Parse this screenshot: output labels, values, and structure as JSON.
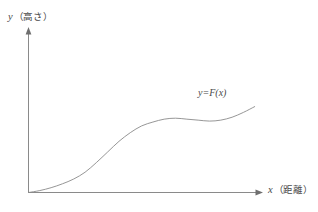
{
  "figure": {
    "background_color": "#ffffff",
    "line_color": "#8a8a8a",
    "text_color": "#4a4a4a"
  },
  "chart_data": {
    "type": "line",
    "title": "",
    "xlabel_var": "x",
    "xlabel_note": "（距離）",
    "ylabel_var": "y",
    "ylabel_note": "（高さ）",
    "series": [
      {
        "name": "y=F(x)",
        "label_var": "y=F(",
        "label_arg": "x",
        "label_close": ")",
        "x": [
          0,
          10,
          20,
          30,
          40,
          50,
          60,
          70,
          80,
          90,
          100,
          110,
          120,
          130,
          140,
          150,
          160,
          170,
          180,
          190,
          200
        ],
        "y": [
          0,
          2,
          5,
          9,
          14,
          21,
          31,
          42,
          53,
          62,
          69,
          73,
          76,
          77,
          76,
          75,
          74,
          75,
          78,
          83,
          89
        ]
      }
    ],
    "xlim": [
      0,
      210
    ],
    "ylim": [
      0,
      100
    ],
    "grid": false,
    "legend": "none",
    "axis_arrows": true,
    "annotations": [
      {
        "text": "y=F(x)",
        "x": 150,
        "y": 96
      }
    ]
  },
  "labels": {
    "y_axis": "y（高さ）",
    "x_axis": "x（距離）",
    "curve": "y=F(x)"
  }
}
